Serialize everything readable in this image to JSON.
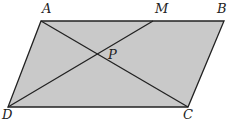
{
  "diagram": {
    "type": "parallelogram",
    "fill_color": "#c9c9c9",
    "stroke_color": "#222222",
    "vertices": {
      "A": {
        "label": "A",
        "x": 41,
        "y": 21
      },
      "B": {
        "label": "B",
        "x": 224,
        "y": 21
      },
      "C": {
        "label": "C",
        "x": 188,
        "y": 107
      },
      "D": {
        "label": "D",
        "x": 8,
        "y": 107
      },
      "M": {
        "label": "M",
        "x": 153,
        "y": 21
      },
      "P": {
        "label": "P",
        "x": 97,
        "y": 53
      }
    },
    "segments": [
      "AB",
      "BC",
      "CD",
      "DA",
      "AC",
      "DM"
    ]
  }
}
